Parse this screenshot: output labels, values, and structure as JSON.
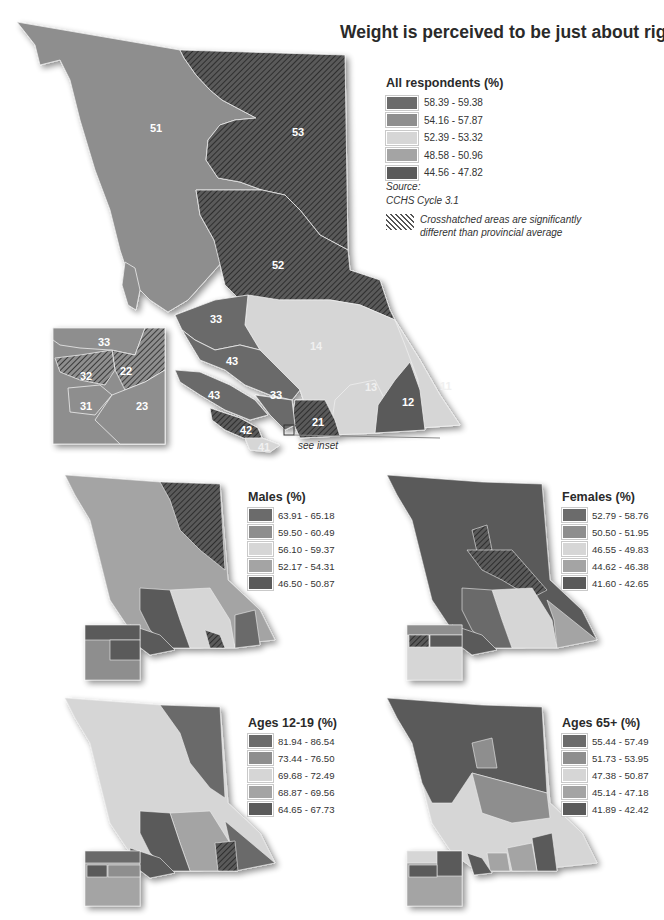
{
  "title": "Weight is perceived to be just about right",
  "colors": {
    "class1": "#6b6b6b",
    "class2": "#8e8e8e",
    "class3": "#d6d6d6",
    "class4": "#a4a4a4",
    "class5": "#5a5a5a",
    "hatch": "#333333",
    "background": "#ffffff"
  },
  "main_map": {
    "legend": {
      "title": "All respondents (%)",
      "ranges": [
        "58.39 - 59.38",
        "54.16 - 57.87",
        "52.39 - 53.32",
        "48.58 - 50.96",
        "44.56 - 47.82"
      ]
    },
    "source_label": "Source:",
    "source_value": "CCHS Cycle 3.1",
    "hatch_note_line1": "Crosshatched areas are significantly",
    "hatch_note_line2": "different than provincial average",
    "see_inset": "see inset",
    "region_labels": [
      "51",
      "53",
      "52",
      "33",
      "14",
      "43",
      "13",
      "11",
      "43",
      "33",
      "12",
      "21",
      "42",
      "41"
    ],
    "inset_labels": [
      "33",
      "32",
      "22",
      "31",
      "23"
    ]
  },
  "small_maps": [
    {
      "id": "males",
      "title": "Males (%)",
      "ranges": [
        "63.91 - 65.18",
        "59.50 - 60.49",
        "56.10 - 59.37",
        "52.17 - 54.31",
        "46.50 - 50.87"
      ]
    },
    {
      "id": "females",
      "title": "Females (%)",
      "ranges": [
        "52.79 - 58.76",
        "50.50 - 51.95",
        "46.55 - 49.83",
        "44.62 - 46.38",
        "41.60 - 42.65"
      ]
    },
    {
      "id": "ages-12-19",
      "title": "Ages 12-19 (%)",
      "ranges": [
        "81.94 - 86.54",
        "73.44 - 76.50",
        "69.68 - 72.49",
        "68.87 - 69.56",
        "64.65 - 67.73"
      ]
    },
    {
      "id": "ages-65-plus",
      "title": "Ages 65+ (%)",
      "ranges": [
        "55.44 - 57.49",
        "51.73 - 53.95",
        "47.38 - 50.87",
        "45.14 - 47.18",
        "41.89 - 42.42"
      ]
    }
  ]
}
